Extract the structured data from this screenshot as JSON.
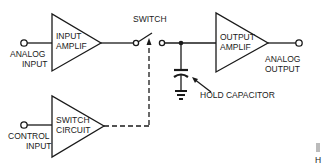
{
  "diagram": {
    "type": "sample-and-hold circuit block diagram",
    "blocks": {
      "input_amp": {
        "line1": "INPUT",
        "line2": "AMPLIF"
      },
      "output_amp": {
        "line1": "OUTPUT",
        "line2": "AMPLIF"
      },
      "switch_circuit": {
        "line1": "SWITCH",
        "line2": "CIRCUIT"
      }
    },
    "labels": {
      "analog_input_1": "ANALOG",
      "analog_input_2": "INPUT",
      "analog_output_1": "ANALOG",
      "analog_output_2": "OUTPUT",
      "control_input_1": "CONTROL",
      "control_input_2": "INPUT",
      "switch": "SWITCH",
      "hold_capacitor": "HOLD CAPACITOR"
    },
    "corner_fragment": "H",
    "colors": {
      "ink": "#1a1a1a",
      "background": "#ffffff",
      "fragment_gray": "#bbbbbb"
    }
  }
}
